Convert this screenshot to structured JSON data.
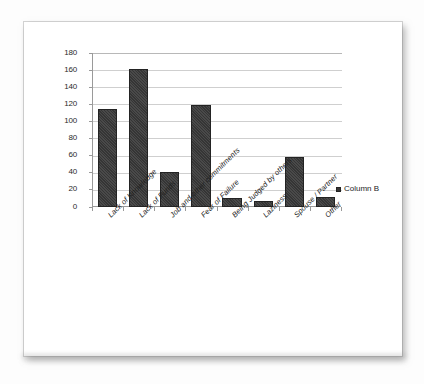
{
  "chart_data": {
    "type": "bar",
    "title": "",
    "subtitle": "",
    "xlabel": "",
    "ylabel": "",
    "ylim": [
      0,
      180
    ],
    "ytick_step": 20,
    "yticks": [
      180,
      160,
      140,
      120,
      100,
      80,
      60,
      40,
      20,
      0
    ],
    "grid": true,
    "legend_position": "right",
    "categories": [
      "Lack of Knowledge",
      "Lack of Funds",
      "Job and other commitments",
      "Fear of Failure",
      "Being Judged by others",
      "Laziness",
      "Spouse / Partner",
      "Other"
    ],
    "series": [
      {
        "name": "Column B",
        "values": [
          114,
          161,
          41,
          119,
          11,
          7,
          59,
          12
        ],
        "color": "#353535"
      }
    ]
  },
  "legend": {
    "entries": [
      {
        "label": "Column B",
        "swatch_name": "legend-swatch-column-b"
      }
    ]
  },
  "colors": {
    "bar": "#353535",
    "bar_border": "#232323",
    "gridline": "#cfcfcf",
    "axis": "#9a9a9a",
    "text": "#202020",
    "page_background": "#fdfdfd",
    "card_background": "#ffffff"
  }
}
